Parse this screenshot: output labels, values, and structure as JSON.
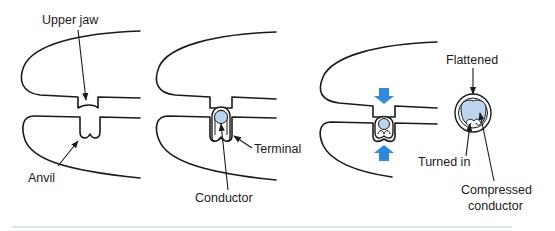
{
  "figure": {
    "type": "crimping-process-diagram",
    "panels": [
      {
        "id": "panel-1-open-die",
        "labels": {
          "upper_jaw": "Upper jaw",
          "anvil": "Anvil"
        }
      },
      {
        "id": "panel-2-terminal-inserted",
        "labels": {
          "terminal": "Terminal",
          "conductor": "Conductor"
        }
      },
      {
        "id": "panel-3-crimping",
        "arrows": [
          "down",
          "up"
        ],
        "labels": {
          "flattened": "Flattened",
          "turned_in": "Turned in",
          "compressed_line1": "Compressed",
          "compressed_line2": "conductor"
        }
      }
    ],
    "colors": {
      "outline": "#1a1a1a",
      "force_arrow": "#2e8ae0",
      "conductor_fill": "#bcd4ee",
      "bottom_rule": "#c9dbe6"
    }
  }
}
